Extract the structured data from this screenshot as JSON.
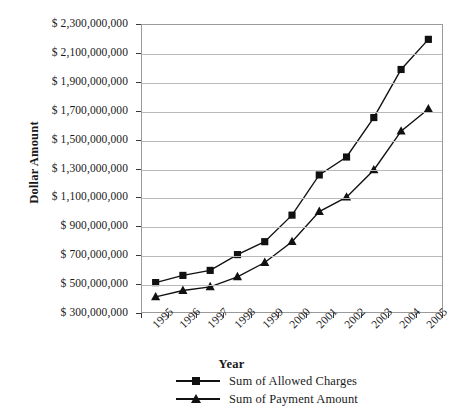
{
  "chart_data": {
    "type": "line",
    "title": "",
    "xlabel": "Year",
    "ylabel": "Dollar Amount",
    "categories": [
      "1995",
      "1996",
      "1997",
      "1998",
      "1999",
      "2000",
      "2001",
      "2002",
      "2003",
      "2004",
      "2005"
    ],
    "x": [
      1995,
      1996,
      1997,
      1998,
      1999,
      2000,
      2001,
      2002,
      2003,
      2004,
      2005
    ],
    "ylim": [
      300000000,
      2300000000
    ],
    "ytick_values": [
      300000000,
      500000000,
      700000000,
      900000000,
      1100000000,
      1300000000,
      1500000000,
      1700000000,
      1900000000,
      2100000000,
      2300000000
    ],
    "ytick_labels": [
      "$ 2,300,000,000",
      "$ 2,100,000,000",
      "$ 1,900,000,000",
      "$ 1,700,000,000",
      "$ 1,500,000,000",
      "$ 1,300,000,000",
      "$ 1,100,000,000",
      "$ 900,000,000",
      "$ 700,000,000",
      "$ 500,000,000",
      "$ 300,000,000"
    ],
    "grid": true,
    "legend_position": "bottom",
    "series": [
      {
        "name": "Sum of Allowed Charges",
        "marker": "square",
        "color": "#111111",
        "values": [
          505000000,
          555000000,
          590000000,
          700000000,
          790000000,
          975000000,
          1255000000,
          1380000000,
          1655000000,
          1990000000,
          2200000000
        ]
      },
      {
        "name": "Sum of Payment Amount",
        "marker": "triangle",
        "color": "#111111",
        "values": [
          405000000,
          450000000,
          475000000,
          545000000,
          645000000,
          790000000,
          1000000000,
          1100000000,
          1290000000,
          1560000000,
          1715000000
        ]
      }
    ]
  },
  "axes": {
    "y_title": "Dollar Amount",
    "x_title": "Year"
  },
  "colors": {
    "series": "#111111",
    "grid": "#b9b9b9",
    "frame": "#9a9a9a",
    "text": "#1a1a1a",
    "background": "#ffffff"
  }
}
